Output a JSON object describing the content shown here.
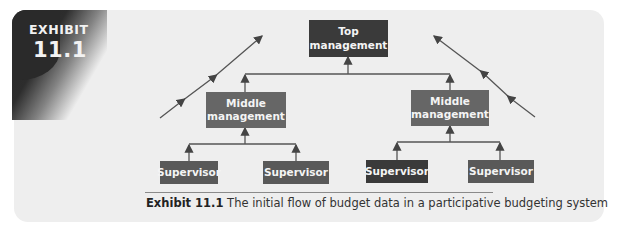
{
  "exhibit": {
    "word": "EXHIBIT",
    "number": "11.1"
  },
  "diagram": {
    "top": {
      "line1": "Top",
      "line2": "management"
    },
    "middle_left": {
      "line1": "Middle",
      "line2": "management"
    },
    "middle_right": {
      "line1": "Middle",
      "line2": "management"
    },
    "supervisors": [
      "Supervisor",
      "Supervisor",
      "Supervisor",
      "Supervisor"
    ]
  },
  "caption": {
    "label": "Exhibit 11.1",
    "text": "The initial flow of budget data in a participative budgeting system"
  },
  "colors": {
    "dark_box": "#3a3a3a",
    "mid_box": "#666666",
    "panel": "#eeeeee"
  }
}
